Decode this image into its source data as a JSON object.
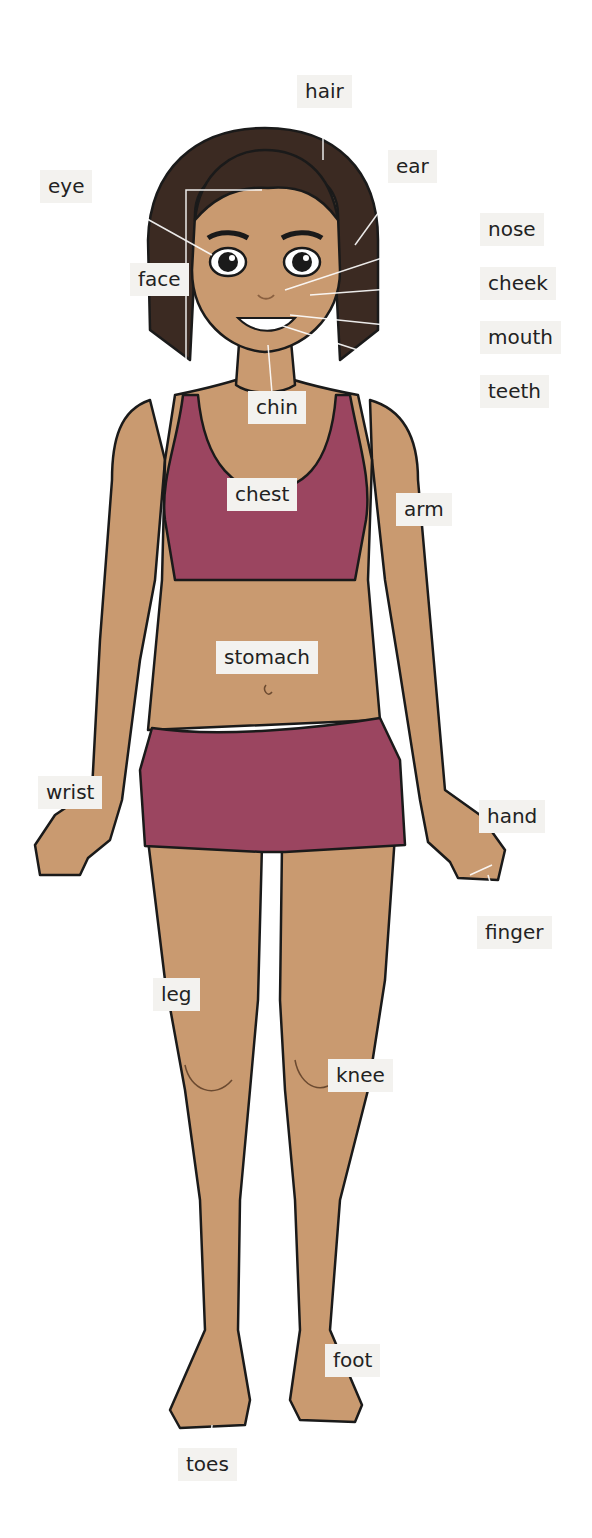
{
  "colors": {
    "skin": "#c99a70",
    "clothing": "#9b4560",
    "hair": "#3b2a22",
    "outline": "#1a1a1a",
    "label_bg": "#f3f2ef",
    "leader_line": "#ffffff"
  },
  "labels": [
    {
      "id": "hair",
      "text": "hair",
      "x": 297,
      "y": 75
    },
    {
      "id": "ear",
      "text": "ear",
      "x": 388,
      "y": 150
    },
    {
      "id": "eye",
      "text": "eye",
      "x": 40,
      "y": 170
    },
    {
      "id": "nose",
      "text": "nose",
      "x": 480,
      "y": 213
    },
    {
      "id": "face",
      "text": "face",
      "x": 130,
      "y": 263
    },
    {
      "id": "cheek",
      "text": "cheek",
      "x": 480,
      "y": 267
    },
    {
      "id": "mouth",
      "text": "mouth",
      "x": 480,
      "y": 321
    },
    {
      "id": "teeth",
      "text": "teeth",
      "x": 480,
      "y": 375
    },
    {
      "id": "chin",
      "text": "chin",
      "x": 248,
      "y": 391
    },
    {
      "id": "chest",
      "text": "chest",
      "x": 227,
      "y": 478
    },
    {
      "id": "arm",
      "text": "arm",
      "x": 396,
      "y": 493
    },
    {
      "id": "stomach",
      "text": "stomach",
      "x": 216,
      "y": 641
    },
    {
      "id": "wrist",
      "text": "wrist",
      "x": 38,
      "y": 776
    },
    {
      "id": "hand",
      "text": "hand",
      "x": 479,
      "y": 800
    },
    {
      "id": "finger",
      "text": "finger",
      "x": 477,
      "y": 916
    },
    {
      "id": "leg",
      "text": "leg",
      "x": 153,
      "y": 978
    },
    {
      "id": "knee",
      "text": "knee",
      "x": 328,
      "y": 1059
    },
    {
      "id": "foot",
      "text": "foot",
      "x": 325,
      "y": 1344
    },
    {
      "id": "toes",
      "text": "toes",
      "x": 178,
      "y": 1448
    }
  ]
}
